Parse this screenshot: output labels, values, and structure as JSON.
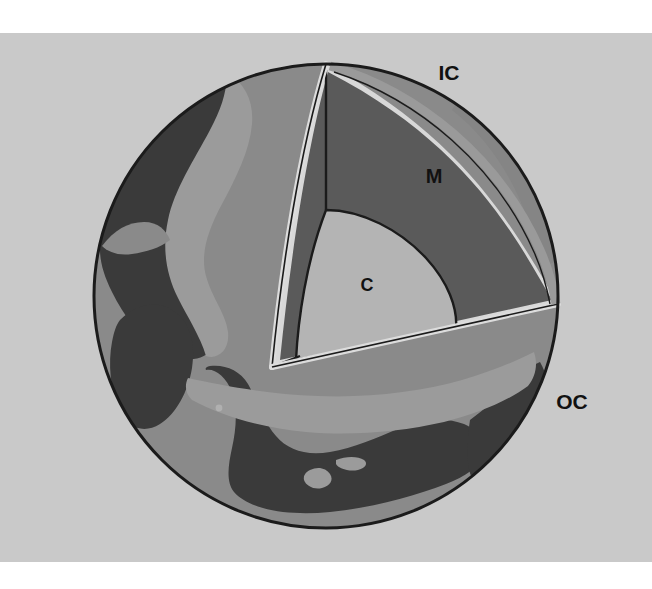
{
  "figure": {
    "background_color": "#ffffff",
    "plate_color": "#c9c9c9",
    "plate": {
      "x": 0,
      "y": 33,
      "width": 652,
      "height": 529
    }
  },
  "sphere": {
    "center_x": 326,
    "center_y": 296,
    "radius": 232,
    "outline_color": "#1b1b1b"
  },
  "layers": [
    {
      "key": "inner_core",
      "label": "IC",
      "name": "Inner core",
      "color": "#7d7d7d"
    },
    {
      "key": "mantle",
      "label": "M",
      "name": "Mantle",
      "color": "#5a5a5a"
    },
    {
      "key": "core",
      "label": "C",
      "name": "Core",
      "color": "#b4b4b4"
    },
    {
      "key": "outer_core",
      "label": "OC",
      "name": "Outer core",
      "color": "#8a8a8a"
    }
  ],
  "labels": [
    {
      "id": "ic",
      "text": "IC",
      "x": 449,
      "y": 80,
      "size": 21,
      "color": "#111111"
    },
    {
      "id": "m",
      "text": "M",
      "x": 434,
      "y": 183,
      "size": 20,
      "color": "#111111"
    },
    {
      "id": "c",
      "text": "C",
      "x": 367,
      "y": 291,
      "size": 18,
      "color": "#111111"
    },
    {
      "id": "oc",
      "text": "OC",
      "x": 572,
      "y": 409,
      "size": 21,
      "color": "#111111"
    }
  ],
  "surface": {
    "ocean_color": "#8a8a8a",
    "land_color": "#3a3a3a",
    "highlight_color": "#9b9b9b",
    "cut_rim_color": "#d8d8d8"
  },
  "cut": {
    "apex_x": 326,
    "apex_y": 64,
    "vertex_x": 272,
    "vertex_y": 367,
    "right_x": 558,
    "right_y": 304
  }
}
